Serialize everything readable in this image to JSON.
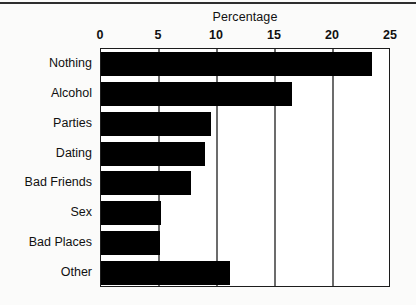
{
  "chart_data": {
    "type": "bar",
    "orientation": "horizontal",
    "title": "Percentage",
    "xlabel": "",
    "ylabel": "",
    "categories": [
      "Nothing",
      "Alcohol",
      "Parties",
      "Dating",
      "Bad Friends",
      "Sex",
      "Bad Places",
      "Other"
    ],
    "values": [
      23.4,
      16.5,
      9.5,
      9.0,
      7.8,
      5.2,
      5.1,
      11.1
    ],
    "xlim": [
      0,
      25
    ],
    "xticks": [
      0,
      5,
      10,
      15,
      20,
      25
    ],
    "xtick_labels": [
      "0",
      "5",
      "10",
      "15",
      "20",
      "25"
    ],
    "gridlines_x": [
      5,
      10,
      15,
      20
    ],
    "grid": true,
    "legend": "none",
    "bar_color": "#000000",
    "plot_background": "#ffffff",
    "axis_color": "#1c1c1c",
    "grid_color": "#6c6c6c"
  }
}
